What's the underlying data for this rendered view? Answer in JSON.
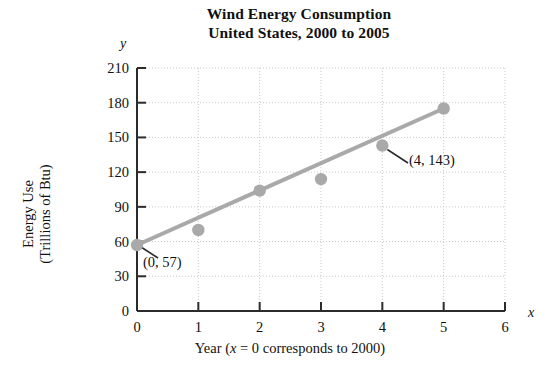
{
  "chart_data": {
    "type": "scatter",
    "title": "Wind Energy Consumption United States, 2000 to 2005",
    "title_lines": [
      "Wind Energy Consumption",
      "United States, 2000 to 2005"
    ],
    "xlabel_parts": {
      "pre": "Year (",
      "math": "x",
      "post": " = 0 corresponds to 2000)"
    },
    "xlabel": "Year (x = 0 corresponds to 2000)",
    "ylabel_lines": [
      "Energy Use",
      "(Trillions of Btu)"
    ],
    "ylabel": "Energy Use (Trillions of Btu)",
    "x_axis_letter": "y",
    "y_axis_letter": "x",
    "axis_letter_x": "x",
    "axis_letter_y": "y",
    "x": [
      0,
      1,
      2,
      3,
      4,
      5
    ],
    "values": [
      57,
      70,
      104,
      114,
      143,
      175
    ],
    "points": [
      {
        "x": 0,
        "y": 57
      },
      {
        "x": 1,
        "y": 70
      },
      {
        "x": 2,
        "y": 104
      },
      {
        "x": 3,
        "y": 114
      },
      {
        "x": 4,
        "y": 143
      },
      {
        "x": 5,
        "y": 175
      }
    ],
    "trend_line": {
      "x1": 0,
      "y1": 57,
      "x2": 5,
      "y2": 175
    },
    "xlim": [
      0,
      6
    ],
    "ylim": [
      0,
      210
    ],
    "xticks": [
      0,
      1,
      2,
      3,
      4,
      5,
      6
    ],
    "yticks": [
      0,
      30,
      60,
      90,
      120,
      150,
      180,
      210
    ],
    "xtick_labels": [
      "0",
      "1",
      "2",
      "3",
      "4",
      "5",
      "6"
    ],
    "ytick_labels": [
      "0",
      "30",
      "60",
      "90",
      "120",
      "150",
      "180",
      "210"
    ],
    "grid": true,
    "legend": null,
    "annotations": [
      {
        "label": "(0, 57)",
        "x": 0,
        "y": 57
      },
      {
        "label": "(4, 143)",
        "x": 4,
        "y": 143
      }
    ],
    "colors": {
      "marker": "#a9a9a9",
      "line": "#a9a9a9",
      "axis": "#2b2b2b",
      "grid": "#c9c9c9",
      "text": "#111111",
      "background": "#ffffff"
    }
  }
}
